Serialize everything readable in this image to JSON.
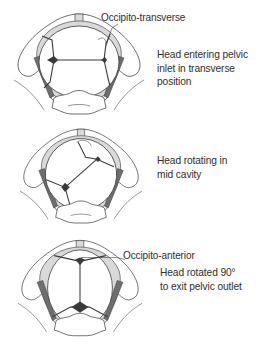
{
  "figure": {
    "colors": {
      "background": "#ffffff",
      "bone_outline": "#4a4a4a",
      "pelvic_rim_shading": "#d9d9d9",
      "ligament_shading": "#6e6e6e",
      "text": "#2e2e2e"
    },
    "stages": [
      {
        "id": "transverse",
        "callout": "Occipito-transverse",
        "caption_lines": [
          "Head entering pelvic",
          "inlet in transverse",
          "position"
        ],
        "head_orientation": "sagittal suture transverse"
      },
      {
        "id": "rotating",
        "callout": "",
        "caption_lines": [
          "Head rotating in",
          "mid cavity"
        ],
        "head_orientation": "sagittal suture oblique"
      },
      {
        "id": "anterior",
        "callout": "Occipito-anterior",
        "caption_lines": [
          "Head rotated 90°",
          "to exit pelvic outlet"
        ],
        "head_orientation": "sagittal suture anteroposterior"
      }
    ]
  }
}
